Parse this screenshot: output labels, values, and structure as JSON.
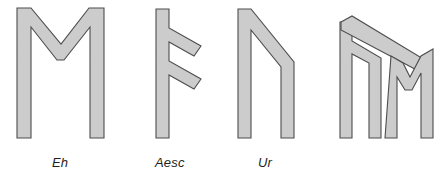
{
  "figure": {
    "background_color": "#ffffff",
    "glyph_fill_color": "#cccccc",
    "glyph_outline_color": "#4d4d4d",
    "label_color": "#231f20"
  },
  "runes": [
    {
      "id": "eh",
      "label": "Eh",
      "shape": "M-shaped rune with two vertical staves joined by a V at the top",
      "has_label": true,
      "outline": "16,8 30,8 30,8 59,47 88,8 118,8 118,138 104,138 104,27 63,82 56,82 30,45 30,138 16,138"
    },
    {
      "id": "aesc",
      "label": "Aesc",
      "shape": "Vertical stave with two downward-slanting branches on the right",
      "has_label": true,
      "outline": "156,8 171,8 171,138 156,138"
    },
    {
      "id": "ur",
      "label": "Ur",
      "shape": "Inverted U with a slanted right stave",
      "has_label": true,
      "outline": "238,8 252,8 252,138 238,138"
    },
    {
      "id": "bind-rune",
      "label": "",
      "shape": "Bind-rune combining Aesc and Eh",
      "has_label": false,
      "outline": ""
    }
  ],
  "labels": {
    "eh": "Eh",
    "aesc": "Aesc",
    "ur": "Ur"
  }
}
